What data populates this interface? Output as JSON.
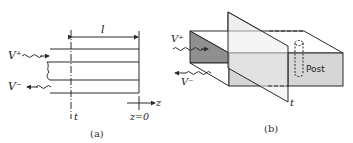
{
  "figure_a": {
    "caption": "(a)",
    "incident_wave_label": "V⁺",
    "reflected_wave_label": "V⁻",
    "length_label": "l",
    "reference_plane_label": "t",
    "axis_label": "z",
    "origin_label": "z=0"
  },
  "figure_b": {
    "caption": "(b)",
    "incident_wave_label": "V⁺",
    "reflected_wave_label": "V⁻",
    "reference_plane_label": "t",
    "post_label": "Post"
  },
  "colors": {
    "line": "#2a2a2a",
    "end_face_dark": "#8f8f8f",
    "front_face_light": "#d6d6d6",
    "top_face": "#ffffff",
    "plane": "#ececec"
  }
}
